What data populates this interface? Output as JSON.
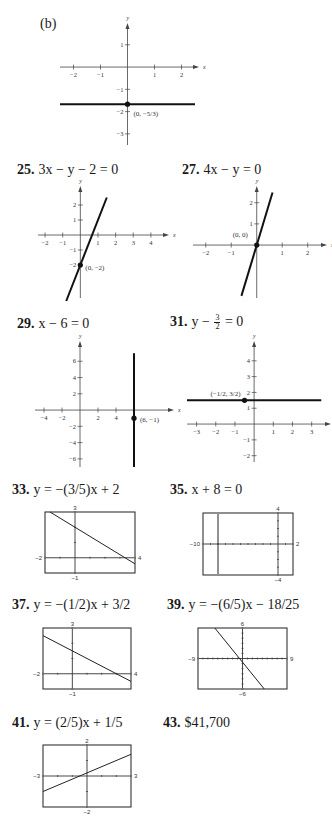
{
  "part_label": "(b)",
  "problems": [
    {
      "number": "25.",
      "equation": "3x − y − 2 = 0",
      "point_label": "(0, −2)"
    },
    {
      "number": "27.",
      "equation": "4x − y = 0",
      "point_label": "(0, 0)"
    },
    {
      "number": "29.",
      "equation": "x − 6 = 0",
      "point_label": "(6, −1)"
    },
    {
      "number": "31.",
      "equation_pre": "y − ",
      "equation_frac": [
        "3",
        "2"
      ],
      "equation_post": " = 0",
      "point_label": "(−1/2, 3/2)"
    },
    {
      "number": "33.",
      "equation": "y = −(3/5)x + 2",
      "eq_parts": [
        "y = −",
        "3",
        "5",
        "x + 2"
      ]
    },
    {
      "number": "35.",
      "equation": "x + 8 = 0"
    },
    {
      "number": "37.",
      "equation": "y = −(1/2)x + 3/2"
    },
    {
      "number": "39.",
      "equation": "y = −(6/5)x − 18/25"
    },
    {
      "number": "41.",
      "equation": "y = (2/5)x + 1/5"
    },
    {
      "number": "43.",
      "answer": "$41,700"
    }
  ],
  "chart_data": [
    {
      "id": "b",
      "type": "line",
      "title": "(b)",
      "xlabel": "x",
      "ylabel": "y",
      "x_ticks": [
        "-2",
        "-1",
        "1",
        "2"
      ],
      "y_ticks": [
        "1",
        "-1",
        "-2",
        "-3"
      ],
      "xlim": [
        -2.5,
        2.5
      ],
      "ylim": [
        -3.5,
        1.8
      ],
      "line": {
        "kind": "horizontal",
        "y": -1.6667,
        "x_range": [
          -2.5,
          2.5
        ]
      },
      "point": {
        "x": 0,
        "y": -1.6667,
        "label": "(0, −5/3)"
      }
    },
    {
      "id": "25",
      "type": "line",
      "equation": "3x − y − 2 = 0",
      "xlabel": "x",
      "ylabel": "y",
      "x_ticks": [
        "-2",
        "-1",
        "1",
        "2",
        "3",
        "4"
      ],
      "y_ticks": [
        "2",
        "1",
        "-1",
        "-2"
      ],
      "xlim": [
        -2.4,
        4.8
      ],
      "ylim": [
        -4.2,
        3
      ],
      "line": {
        "slope": 3,
        "intercept": -2,
        "x_range": [
          -0.8,
          1.5
        ]
      },
      "point": {
        "x": 0,
        "y": -2,
        "label": "(0, −2)"
      }
    },
    {
      "id": "27",
      "type": "line",
      "equation": "4x − y = 0",
      "xlabel": "x",
      "ylabel": "y",
      "x_ticks": [
        "-2",
        "-1",
        "1",
        "2"
      ],
      "y_ticks": [
        "2",
        "1"
      ],
      "xlim": [
        -2.5,
        2.6
      ],
      "ylim": [
        -2.5,
        2.6
      ],
      "line": {
        "slope": 4,
        "intercept": 0,
        "x_range": [
          -0.6,
          0.62
        ]
      },
      "point": {
        "x": 0,
        "y": 0,
        "label": "(0, 0)"
      }
    },
    {
      "id": "29",
      "type": "line",
      "equation": "x − 6 = 0",
      "xlabel": "x",
      "ylabel": "y",
      "x_ticks": [
        "-4",
        "-2",
        "2",
        "4"
      ],
      "y_ticks": [
        "6",
        "4",
        "2",
        "-2",
        "-4",
        "-6"
      ],
      "xlim": [
        -5,
        10
      ],
      "ylim": [
        -7,
        8
      ],
      "line": {
        "kind": "vertical",
        "x": 6,
        "y_range": [
          -7,
          7
        ]
      },
      "point": {
        "x": 6,
        "y": -1,
        "label": "(6, −1)"
      }
    },
    {
      "id": "31",
      "type": "line",
      "equation": "y − 3/2 = 0",
      "xlabel": "x",
      "ylabel": "y",
      "x_ticks": [
        "-3",
        "-2",
        "-1",
        "1",
        "2",
        "3"
      ],
      "y_ticks": [
        "4",
        "3",
        "2",
        "1",
        "-1",
        "-2"
      ],
      "xlim": [
        -3.5,
        3.8
      ],
      "ylim": [
        -2.4,
        5
      ],
      "line": {
        "kind": "horizontal",
        "y": 1.5,
        "x_range": [
          -3.5,
          3.5
        ]
      },
      "point": {
        "x": -0.5,
        "y": 1.5,
        "label": "(−1/2, 3/2)"
      }
    },
    {
      "id": "33",
      "type": "line",
      "style": "calculator",
      "equation": "y = −(3/5)x + 2",
      "window": {
        "xmin": -2,
        "xmax": 4,
        "ymin": -1,
        "ymax": 3
      },
      "labels": {
        "xmin": "-2",
        "xmax": "4",
        "ymin": "-1",
        "ymax": "3"
      },
      "line": {
        "slope": -0.6,
        "intercept": 2
      }
    },
    {
      "id": "35",
      "type": "line",
      "style": "calculator",
      "equation": "x + 8 = 0",
      "window": {
        "xmin": -10,
        "xmax": 2,
        "ymin": -4,
        "ymax": 4
      },
      "labels": {
        "xmin": "-10",
        "xmax": "2",
        "ymin": "-4",
        "ymax": "4"
      },
      "line": {
        "kind": "vertical",
        "x": -8
      }
    },
    {
      "id": "37",
      "type": "line",
      "style": "calculator",
      "equation": "y = −(1/2)x + 3/2",
      "window": {
        "xmin": -2,
        "xmax": 4,
        "ymin": -1,
        "ymax": 3
      },
      "labels": {
        "xmin": "-2",
        "xmax": "4",
        "ymin": "-1",
        "ymax": "3"
      },
      "line": {
        "slope": -0.5,
        "intercept": 1.5
      }
    },
    {
      "id": "39",
      "type": "line",
      "style": "calculator",
      "equation": "y = −(6/5)x − 18/25",
      "window": {
        "xmin": -9,
        "xmax": 9,
        "ymin": -6,
        "ymax": 6
      },
      "labels": {
        "xmin": "-9",
        "xmax": "9",
        "ymin": "-6",
        "ymax": "6"
      },
      "line": {
        "slope": -1.2,
        "intercept": -0.72
      }
    },
    {
      "id": "41",
      "type": "line",
      "style": "calculator",
      "equation": "y = (2/5)x + 1/5",
      "window": {
        "xmin": -3,
        "xmax": 3,
        "ymin": -2,
        "ymax": 2
      },
      "labels": {
        "xmin": "-3",
        "xmax": "3",
        "ymin": "-2",
        "ymax": "2"
      },
      "line": {
        "slope": 0.4,
        "intercept": 0.2
      }
    }
  ]
}
